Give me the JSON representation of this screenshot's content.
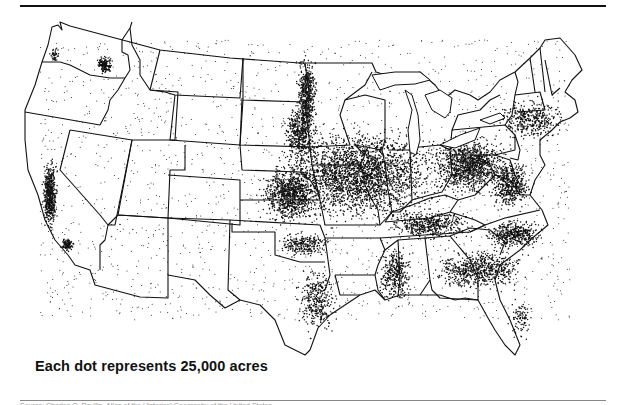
{
  "map": {
    "title": "Harvested cropland dot-density map of the conterminous United States",
    "caption": "Each dot represents 25,000 acres",
    "source_line": "Source: Charles O. Paullin, Atlas of the Historical Geography of the United States",
    "colors": {
      "ink": "#111111",
      "background": "#ffffff"
    },
    "dense_regions": [
      {
        "name": "Corn Belt / Midwest",
        "cx": 360,
        "cy": 175,
        "rx": 95,
        "ry": 55,
        "n": 2600
      },
      {
        "name": "Red River Valley",
        "cx": 307,
        "cy": 95,
        "rx": 12,
        "ry": 45,
        "n": 500
      },
      {
        "name": "Eastern Dakotas",
        "cx": 300,
        "cy": 135,
        "rx": 20,
        "ry": 35,
        "n": 450
      },
      {
        "name": "Kansas / Nebraska wheat",
        "cx": 290,
        "cy": 195,
        "rx": 35,
        "ry": 35,
        "n": 900
      },
      {
        "name": "Ohio / Pennsylvania",
        "cx": 470,
        "cy": 165,
        "rx": 45,
        "ry": 35,
        "n": 1100
      },
      {
        "name": "Virginia / Maryland",
        "cx": 510,
        "cy": 185,
        "rx": 25,
        "ry": 30,
        "n": 500
      },
      {
        "name": "Kentucky / Tennessee",
        "cx": 430,
        "cy": 225,
        "rx": 50,
        "ry": 18,
        "n": 500
      },
      {
        "name": "Southeast coastal plain",
        "cx": 480,
        "cy": 270,
        "rx": 55,
        "ry": 25,
        "n": 650
      },
      {
        "name": "Mississippi Delta",
        "cx": 395,
        "cy": 275,
        "rx": 20,
        "ry": 35,
        "n": 350
      },
      {
        "name": "Texas blackland",
        "cx": 318,
        "cy": 300,
        "rx": 25,
        "ry": 40,
        "n": 350
      },
      {
        "name": "Oklahoma",
        "cx": 305,
        "cy": 245,
        "rx": 30,
        "ry": 15,
        "n": 250
      },
      {
        "name": "California Central Valley",
        "cx": 50,
        "cy": 195,
        "rx": 9,
        "ry": 40,
        "n": 550
      },
      {
        "name": "Southern California",
        "cx": 67,
        "cy": 245,
        "rx": 8,
        "ry": 8,
        "n": 120
      },
      {
        "name": "Palouse",
        "cx": 105,
        "cy": 65,
        "rx": 10,
        "ry": 10,
        "n": 160
      },
      {
        "name": "Western Washington",
        "cx": 55,
        "cy": 55,
        "rx": 6,
        "ry": 8,
        "n": 40
      },
      {
        "name": "New York / New England",
        "cx": 530,
        "cy": 120,
        "rx": 40,
        "ry": 25,
        "n": 400
      },
      {
        "name": "Carolinas piedmont",
        "cx": 515,
        "cy": 235,
        "rx": 35,
        "ry": 18,
        "n": 450
      },
      {
        "name": "Florida",
        "cx": 520,
        "cy": 320,
        "rx": 15,
        "ry": 25,
        "n": 90
      }
    ],
    "sparse_dots": 1800
  }
}
